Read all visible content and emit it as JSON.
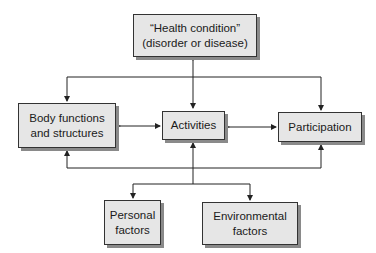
{
  "diagram": {
    "nodes": {
      "health": {
        "line1": "“Health condition”",
        "line2": "(disorder or disease)"
      },
      "body": {
        "line1": "Body functions",
        "line2": "and structures"
      },
      "activities": {
        "line1": "Activities"
      },
      "participation": {
        "line1": "Participation"
      },
      "personal": {
        "line1": "Personal",
        "line2": "factors"
      },
      "environmental": {
        "line1": "Environmental",
        "line2": "factors"
      }
    },
    "colors": {
      "box_fill": "#e6e6e6",
      "line": "#222222",
      "shadow": "#8a8a8a"
    }
  }
}
